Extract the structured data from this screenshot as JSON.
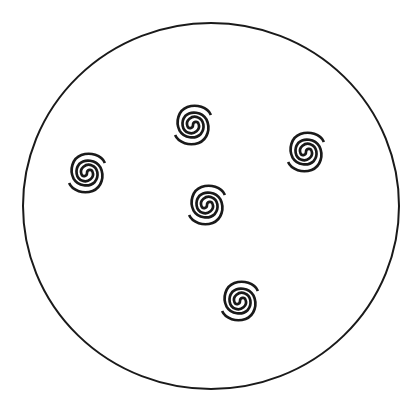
{
  "diagram": {
    "background": "#ffffff",
    "stroke_color": "#1a1a1a",
    "boundary": {
      "shape": "circle",
      "cx": 211,
      "cy": 206,
      "rx": 188,
      "ry": 183
    },
    "spirals": [
      {
        "id": 1,
        "cx": 193,
        "cy": 125
      },
      {
        "id": 2,
        "cx": 306,
        "cy": 152
      },
      {
        "id": 3,
        "cx": 87,
        "cy": 173
      },
      {
        "id": 4,
        "cx": 207,
        "cy": 205
      },
      {
        "id": 5,
        "cx": 240,
        "cy": 301
      }
    ],
    "spiral_size": 38
  }
}
